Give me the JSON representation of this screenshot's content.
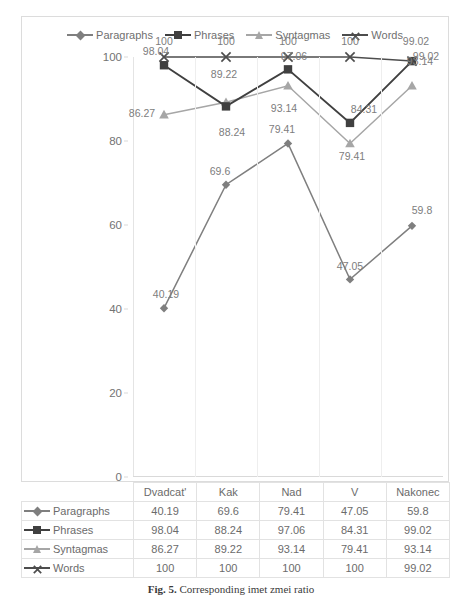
{
  "chart_data": {
    "type": "line",
    "title": "",
    "xlabel": "",
    "ylabel": "",
    "ylim": [
      0,
      100
    ],
    "yticks": [
      0,
      20,
      40,
      60,
      80,
      100
    ],
    "grid": "vertical",
    "legend_position": "top-center",
    "categories": [
      "Dvadcat'",
      "Kak",
      "Nad",
      "V",
      "Nakonec"
    ],
    "series": [
      {
        "name": "Paragraphs",
        "marker": "diamond",
        "color": "#7f7f7f",
        "values": [
          40.19,
          69.6,
          79.41,
          47.05,
          59.8
        ]
      },
      {
        "name": "Phrases",
        "marker": "square",
        "color": "#404040",
        "values": [
          98.04,
          88.24,
          97.06,
          84.31,
          99.02
        ]
      },
      {
        "name": "Syntagmas",
        "marker": "triangle",
        "color": "#a6a6a6",
        "values": [
          86.27,
          89.22,
          93.14,
          79.41,
          93.14
        ]
      },
      {
        "name": "Words",
        "marker": "cross",
        "color": "#4d4d4d",
        "values": [
          100,
          100,
          100,
          100,
          99.02
        ]
      }
    ],
    "data_labels": {
      "Paragraphs": [
        "40.19",
        "69.6",
        "79.41",
        "47.05",
        "59.8"
      ],
      "Phrases": [
        "98.04",
        "88.24",
        "97.06",
        "84.31",
        "99.02"
      ],
      "Syntagmas": [
        "86.27",
        "89.22",
        "93.14",
        "79.41",
        "93.14"
      ],
      "Words": [
        "100",
        "100",
        "100",
        "100",
        "99.02"
      ]
    }
  },
  "legend": {
    "items": [
      {
        "label": "Paragraphs"
      },
      {
        "label": "Phrases"
      },
      {
        "label": "Syntagmas"
      },
      {
        "label": "Words"
      }
    ]
  },
  "table": {
    "corner": "",
    "columns": [
      "Dvadcat'",
      "Kak",
      "Nad",
      "V",
      "Nakonec"
    ],
    "rows": [
      {
        "label": "Paragraphs",
        "values": [
          "40.19",
          "69.6",
          "79.41",
          "47.05",
          "59.8"
        ]
      },
      {
        "label": "Phrases",
        "values": [
          "98.04",
          "88.24",
          "97.06",
          "84.31",
          "99.02"
        ]
      },
      {
        "label": "Syntagmas",
        "values": [
          "86.27",
          "89.22",
          "93.14",
          "79.41",
          "93.14"
        ]
      },
      {
        "label": "Words",
        "values": [
          "100",
          "100",
          "100",
          "100",
          "99.02"
        ]
      }
    ]
  },
  "caption": {
    "prefix": "Fig. 5.",
    "text": "Corresponding imet   zmei   ratio"
  }
}
